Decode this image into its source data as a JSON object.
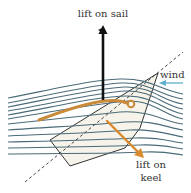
{
  "figure": {
    "type": "sailboat-lift-diagram",
    "labels": {
      "lift_on_sail": "lift on sail",
      "wind": "wind",
      "lift_on_keel_line1": "lift on",
      "lift_on_keel_line2": "keel"
    },
    "colors": {
      "streamline": "#4a6b78",
      "sail": "#c98a3a",
      "keel_arrow": "#d98a2c",
      "sail_arrow": "#111111",
      "wind_arrow": "#5fb0cc",
      "hull_fill": "#f5f3ea",
      "hull_stroke": "#333333",
      "dashed_line": "#333333"
    }
  }
}
